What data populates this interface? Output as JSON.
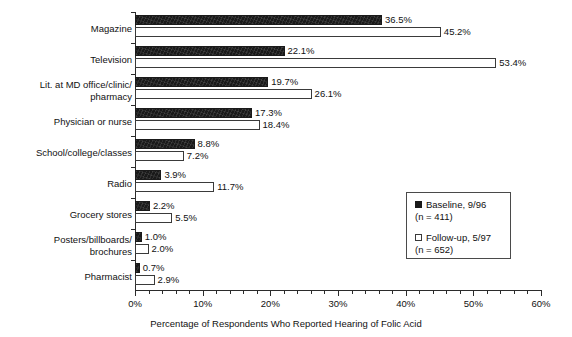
{
  "chart_data": {
    "type": "bar",
    "orientation": "horizontal",
    "title": "",
    "xlabel": "Percentage of Respondents Who Reported Hearing of Folic Acid",
    "ylabel": "",
    "xlim": [
      0,
      60
    ],
    "xtick_labels": [
      "0%",
      "10%",
      "20%",
      "30%",
      "40%",
      "50%",
      "60%"
    ],
    "xticks": [
      0,
      10,
      20,
      30,
      40,
      50,
      60
    ],
    "xtick_minor_step": 2,
    "grid": false,
    "legend_position": "center-right",
    "categories": [
      "Magazine",
      "Television",
      "Lit. at MD office/clinic/\npharmacy",
      "Physician or nurse",
      "School/college/classes",
      "Radio",
      "Grocery stores",
      "Posters/billboards/\nbrochures",
      "Pharmacist"
    ],
    "series": [
      {
        "name": "Baseline, 9/96",
        "sub": "(n = 411)",
        "color": "#1a1a1a",
        "style": "filled",
        "values": [
          36.5,
          22.1,
          19.7,
          17.3,
          8.8,
          3.9,
          2.2,
          1.0,
          0.7
        ],
        "labels": [
          "36.5%",
          "22.1%",
          "19.7%",
          "17.3%",
          "8.8%",
          "3.9%",
          "2.2%",
          "1.0%",
          "0.7%"
        ]
      },
      {
        "name": "Follow-up, 5/97",
        "sub": "(n = 652)",
        "color": "#ffffff",
        "style": "outlined",
        "values": [
          45.2,
          53.4,
          26.1,
          18.4,
          7.2,
          11.7,
          5.5,
          2.0,
          2.9
        ],
        "labels": [
          "45.2%",
          "53.4%",
          "26.1%",
          "18.4%",
          "7.2%",
          "11.7%",
          "5.5%",
          "2.0%",
          "2.9%"
        ]
      }
    ]
  },
  "legend": {
    "entries": [
      {
        "label": "Baseline, 9/96",
        "sub": "(n = 411)"
      },
      {
        "label": "Follow-up, 5/97",
        "sub": "(n = 652)"
      }
    ]
  }
}
